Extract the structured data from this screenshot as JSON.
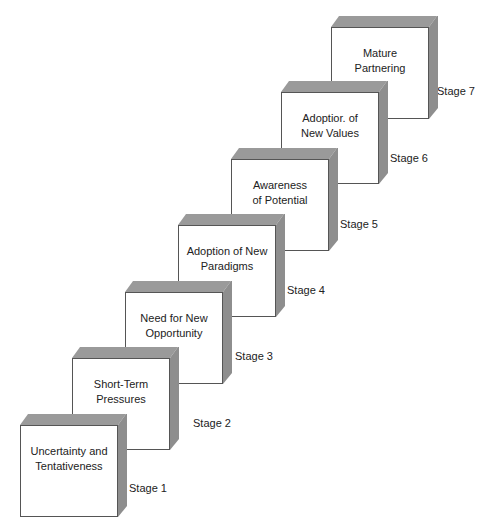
{
  "diagram": {
    "title": "",
    "type": "staircase",
    "stages": [
      {
        "stage": "Stage 1",
        "line1": "Uncertainty and",
        "line2": "Tentativeness"
      },
      {
        "stage": "Stage 2",
        "line1": "Short-Term",
        "line2": "Pressures"
      },
      {
        "stage": "Stage 3",
        "line1": "Need for New",
        "line2": "Opportunity"
      },
      {
        "stage": "Stage 4",
        "line1": "Adoption of New",
        "line2": "Paradigms"
      },
      {
        "stage": "Stage 5",
        "line1": "Awareness",
        "line2": "of Potential"
      },
      {
        "stage": "Stage 6",
        "line1": "Adoptior. of",
        "line2": "New Values"
      },
      {
        "stage": "Stage 7",
        "line1": "Mature",
        "line2": "Partnering"
      }
    ]
  }
}
